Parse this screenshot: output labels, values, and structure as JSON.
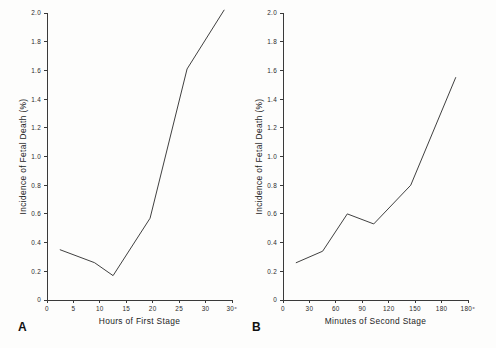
{
  "figure": {
    "background_color": "#fdfdfc",
    "line_color": "#2a2a2a",
    "axis_color": "#3a3a3a"
  },
  "panel_a": {
    "letter": "A",
    "xlabel": "Hours of First Stage",
    "ylabel": "Incidence of Fetal Death (%)",
    "xticklabels": [
      "0",
      "5",
      "10",
      "15",
      "20",
      "25",
      "30",
      "30⁺"
    ],
    "yticklabels": [
      "0",
      "0.2",
      "0.4",
      "0.6",
      "0.8",
      "1.0",
      "1.2",
      "1.4",
      "1.6",
      "1.8",
      "2.0"
    ]
  },
  "panel_b": {
    "letter": "B",
    "xlabel": "Minutes of Second Stage",
    "ylabel": "Incidence of Fetal Death (%)",
    "xticklabels": [
      "0",
      "30",
      "60",
      "90",
      "120",
      "150",
      "180",
      "180⁺"
    ],
    "yticklabels": [
      "0",
      "0.2",
      "0.4",
      "0.6",
      "0.8",
      "1.0",
      "1.2",
      "1.4",
      "1.6",
      "1.8",
      "2.0"
    ]
  },
  "chart_data": [
    {
      "type": "line",
      "panel": "A",
      "title": "",
      "xlabel": "Hours of First Stage",
      "ylabel": "Incidence of Fetal Death (%)",
      "xlim": [
        0,
        35
      ],
      "ylim": [
        0,
        2.0
      ],
      "xticks": [
        0,
        5,
        10,
        15,
        20,
        25,
        30,
        35
      ],
      "xticklabels": [
        "0",
        "5",
        "10",
        "15",
        "20",
        "25",
        "30",
        "30⁺"
      ],
      "yticks": [
        0,
        0.2,
        0.4,
        0.6,
        0.8,
        1.0,
        1.2,
        1.4,
        1.6,
        1.8,
        2.0
      ],
      "yticklabels": [
        "0",
        "0.2",
        "0.4",
        "0.6",
        "0.8",
        "1.0",
        "1.2",
        "1.4",
        "1.6",
        "1.8",
        "2.0"
      ],
      "grid": false,
      "legend": null,
      "x": [
        2.5,
        9.0,
        12.5,
        19.5,
        26.5,
        33.5
      ],
      "y": [
        0.35,
        0.26,
        0.17,
        0.57,
        1.61,
        2.02
      ],
      "series": [
        {
          "name": "Incidence of fetal death vs hours of first stage",
          "points": [
            {
              "x": 2.5,
              "y": 0.35
            },
            {
              "x": 9.0,
              "y": 0.26
            },
            {
              "x": 12.5,
              "y": 0.17
            },
            {
              "x": 19.5,
              "y": 0.57
            },
            {
              "x": 26.5,
              "y": 1.61
            },
            {
              "x": 33.5,
              "y": 2.02
            }
          ]
        }
      ]
    },
    {
      "type": "line",
      "panel": "B",
      "title": "",
      "xlabel": "Minutes of Second Stage",
      "ylabel": "Incidence of Fetal Death (%)",
      "xlim": [
        0,
        210
      ],
      "ylim": [
        0,
        2.0
      ],
      "xticks": [
        0,
        30,
        60,
        90,
        120,
        150,
        180,
        210
      ],
      "xticklabels": [
        "0",
        "30",
        "60",
        "90",
        "120",
        "150",
        "180",
        "180⁺"
      ],
      "yticks": [
        0,
        0.2,
        0.4,
        0.6,
        0.8,
        1.0,
        1.2,
        1.4,
        1.6,
        1.8,
        2.0
      ],
      "yticklabels": [
        "0",
        "0.2",
        "0.4",
        "0.6",
        "0.8",
        "1.0",
        "1.2",
        "1.4",
        "1.6",
        "1.8",
        "2.0"
      ],
      "grid": false,
      "legend": null,
      "x": [
        15,
        45,
        73,
        103,
        145,
        196
      ],
      "y": [
        0.26,
        0.34,
        0.6,
        0.53,
        0.8,
        1.55
      ],
      "series": [
        {
          "name": "Incidence of fetal death vs minutes of second stage",
          "points": [
            {
              "x": 15,
              "y": 0.26
            },
            {
              "x": 45,
              "y": 0.34
            },
            {
              "x": 73,
              "y": 0.6
            },
            {
              "x": 103,
              "y": 0.53
            },
            {
              "x": 145,
              "y": 0.8
            },
            {
              "x": 196,
              "y": 1.55
            }
          ]
        }
      ]
    }
  ]
}
